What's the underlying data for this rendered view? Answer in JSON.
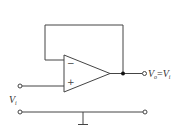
{
  "diagram": {
    "opamp": {
      "minus_sign": "−",
      "plus_sign": "+"
    },
    "labels": {
      "input": {
        "main": "V",
        "sub": "i"
      },
      "output": {
        "main": "V",
        "sub": "o",
        "eq": "=",
        "main2": "V",
        "sub2": "i"
      }
    },
    "colors": {
      "stroke": "#444444",
      "text": "#333333",
      "background": "#ffffff"
    }
  }
}
